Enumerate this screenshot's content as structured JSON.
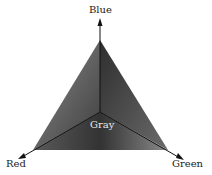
{
  "diagram": {
    "type": "color-space-triangle",
    "axes": [
      {
        "name": "Blue",
        "direction": "up"
      },
      {
        "name": "Red",
        "direction": "down-left"
      },
      {
        "name": "Green",
        "direction": "down-right"
      }
    ],
    "center_label": "Gray",
    "colors": {
      "fill_dark": "#3a3a3a",
      "fill_mid": "#5a5a5a",
      "fill_light": "#8a8a8a",
      "axis_line": "#111111",
      "label_text": "#222222",
      "center_text": "#e8e8e8"
    }
  }
}
